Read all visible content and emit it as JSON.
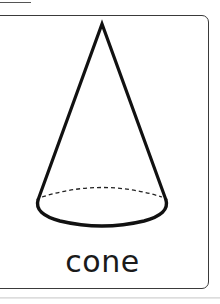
{
  "card": {
    "label": "cone",
    "shape": "cone-icon"
  },
  "colors": {
    "stroke": "#111111",
    "border": "#3a3a3a",
    "background": "#ffffff"
  }
}
